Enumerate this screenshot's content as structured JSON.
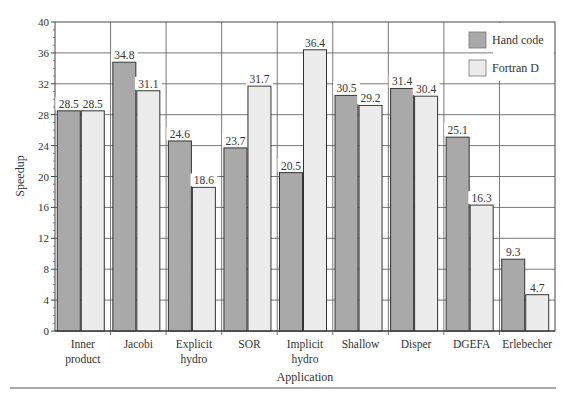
{
  "chart_data": {
    "type": "bar",
    "title": "",
    "xlabel": "Application",
    "ylabel": "Speedup",
    "ylim": [
      0,
      40
    ],
    "yticks": [
      0,
      4,
      8,
      12,
      16,
      20,
      24,
      28,
      32,
      36,
      40
    ],
    "grid": true,
    "legend_position": "top-right",
    "categories": [
      [
        "Inner",
        "product"
      ],
      [
        "Jacobi"
      ],
      [
        "Explicit",
        "hydro"
      ],
      [
        "SOR"
      ],
      [
        "Implicit",
        "hydro"
      ],
      [
        "Shallow"
      ],
      [
        "Disper"
      ],
      [
        "DGEFA"
      ],
      [
        "Erlebecher"
      ]
    ],
    "series": [
      {
        "name": "Hand code",
        "color": "#a9a9a9",
        "values": [
          28.5,
          34.8,
          24.6,
          23.7,
          20.5,
          30.5,
          31.4,
          25.1,
          9.3
        ]
      },
      {
        "name": "Fortran D",
        "color": "#ececec",
        "values": [
          28.5,
          31.1,
          18.6,
          31.7,
          36.4,
          29.2,
          30.4,
          16.3,
          4.7
        ]
      }
    ]
  }
}
